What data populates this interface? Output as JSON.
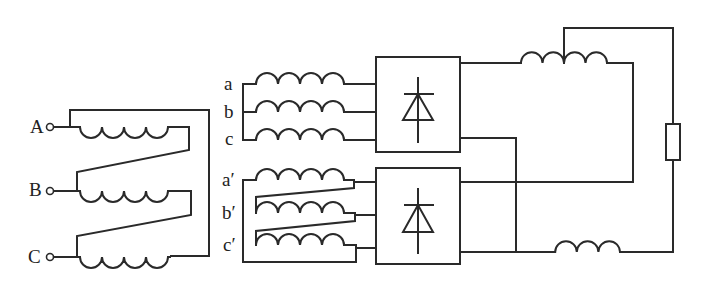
{
  "diagram": {
    "title": "",
    "type": "12-pulse rectifier with interphase reactor",
    "primary": {
      "connection": "delta",
      "terminals": [
        "A",
        "B",
        "C"
      ]
    },
    "secondary_wye": {
      "connection": "wye",
      "labels": [
        "a",
        "b",
        "c"
      ]
    },
    "secondary_delta": {
      "connection": "delta",
      "labels": [
        "a′",
        "b′",
        "c′"
      ]
    },
    "converters": [
      {
        "name": "rectifier-bridge-1",
        "icon": "diode-icon"
      },
      {
        "name": "rectifier-bridge-2",
        "icon": "diode-icon"
      }
    ],
    "output": {
      "interphase_reactor": "center-tapped inductor",
      "smoothing_inductor": "inductor",
      "load": "resistor"
    },
    "colors": {
      "stroke": "#2a2a2a",
      "background": "#ffffff"
    }
  }
}
